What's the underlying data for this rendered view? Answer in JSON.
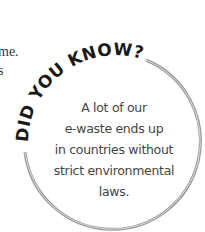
{
  "fragments": [
    "me.",
    "s",
    "."
  ],
  "callout": {
    "heading": "DID YOU KNOW?",
    "lines": [
      "A lot of our",
      "e-waste ends up",
      "in countries without",
      "strict environmental",
      "laws."
    ],
    "ring_color": "#9a9a9a",
    "heading_color": "#1a1a1a"
  }
}
